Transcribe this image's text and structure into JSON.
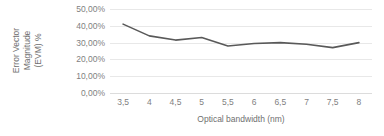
{
  "chart_data": {
    "type": "line",
    "title": "",
    "xlabel": "Optical bandwidth (nm)",
    "ylabel": "Error Vector Magnitude (EVM) %",
    "ylabel_lines": [
      "Error Vector",
      "Magnitude",
      "(EVM) %"
    ],
    "categories": [
      "3,5",
      "4",
      "4,5",
      "5",
      "5,5",
      "6",
      "6,5",
      "7",
      "7,5",
      "8"
    ],
    "x": [
      3.5,
      4,
      4.5,
      5,
      5.5,
      6,
      6.5,
      7,
      7.5,
      8
    ],
    "values": [
      41.0,
      34.0,
      31.5,
      33.0,
      28.0,
      29.5,
      30.0,
      29.0,
      27.0,
      30.0
    ],
    "ytick_labels": [
      "50,00%",
      "40,00%",
      "30,00%",
      "20,00%",
      "10,00%",
      "0,00%"
    ],
    "ytick_values": [
      50,
      40,
      30,
      20,
      10,
      0
    ],
    "ylim": [
      0,
      50
    ],
    "grid": true,
    "legend": "none",
    "series_color": "#595959",
    "grid_color": "#e8e8e8",
    "text_color": "#7f7f7f",
    "background_color": "#ffffff"
  }
}
